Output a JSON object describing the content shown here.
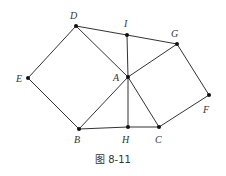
{
  "caption": "图 8-11",
  "points": {
    "D": {
      "label": "D",
      "x": 76,
      "y": 26,
      "lx": 70,
      "ly": 19
    },
    "I": {
      "label": "I",
      "x": 127,
      "y": 35,
      "lx": 124,
      "ly": 27
    },
    "G": {
      "label": "G",
      "x": 177,
      "y": 44,
      "lx": 171,
      "ly": 37
    },
    "E": {
      "label": "E",
      "x": 28,
      "y": 78,
      "lx": 16,
      "ly": 82
    },
    "A": {
      "label": "A",
      "x": 128,
      "y": 77,
      "lx": 113,
      "ly": 81
    },
    "F": {
      "label": "F",
      "x": 209,
      "y": 95,
      "lx": 203,
      "ly": 113
    },
    "B": {
      "label": "B",
      "x": 79,
      "y": 129,
      "lx": 74,
      "ly": 143
    },
    "H": {
      "label": "H",
      "x": 128,
      "y": 127,
      "lx": 122,
      "ly": 143
    },
    "C": {
      "label": "C",
      "x": 159,
      "y": 127,
      "lx": 155,
      "ly": 143
    }
  },
  "edges": [
    [
      "D",
      "I"
    ],
    [
      "I",
      "G"
    ],
    [
      "D",
      "E"
    ],
    [
      "E",
      "B"
    ],
    [
      "D",
      "A"
    ],
    [
      "A",
      "C"
    ],
    [
      "I",
      "A"
    ],
    [
      "A",
      "H"
    ],
    [
      "A",
      "G"
    ],
    [
      "A",
      "B"
    ],
    [
      "B",
      "H"
    ],
    [
      "H",
      "C"
    ],
    [
      "G",
      "F"
    ],
    [
      "F",
      "C"
    ]
  ]
}
